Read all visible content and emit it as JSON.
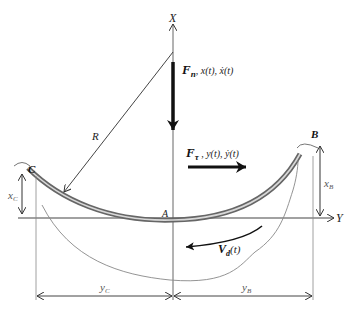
{
  "diagram": {
    "axes": {
      "x_label": "X",
      "y_label": "Y"
    },
    "points": {
      "A": "A",
      "B": "B",
      "C": "C"
    },
    "radius_label": "R",
    "normal_force": {
      "symbol": "F",
      "subscript": "n",
      "rest": ", x(t), ẋ(t)"
    },
    "tangential_force": {
      "symbol": "F",
      "subscript": "τ",
      "rest": " , y(t), ẏ(t)"
    },
    "velocity": {
      "symbol": "V",
      "subscript": "d",
      "rest": "(t)"
    },
    "dimensions": {
      "xC": {
        "main": "x",
        "sub": "C"
      },
      "xB": {
        "main": "x",
        "sub": "B"
      },
      "yC": {
        "main": "y",
        "sub": "C"
      },
      "yB": {
        "main": "y",
        "sub": "B"
      }
    },
    "colors": {
      "line": "#333333",
      "track_outer": "#555555",
      "track_inner": "#bbbbbb",
      "thin": "#888888"
    }
  }
}
